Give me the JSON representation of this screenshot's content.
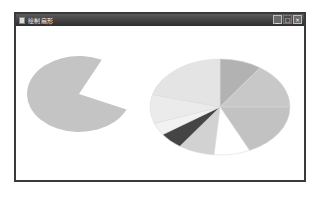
{
  "window": {
    "title": "绘制扇形",
    "controls": {
      "minimize_label": "_",
      "maximize_label": "□",
      "close_label": "×"
    }
  },
  "colors": {
    "titlebar": "#3a3a3a",
    "window_border": "#3a3a3a",
    "left_pie_fill": "#c4c4c4"
  },
  "left_pie": {
    "cx": 63,
    "cy": 68,
    "rx": 52,
    "ry": 38,
    "missing_wedge_deg": [
      296,
      24
    ],
    "fill": "#c4c4c4"
  },
  "right_pie": {
    "cx": 204,
    "cy": 81,
    "rx": 70,
    "ry": 48,
    "slices": [
      {
        "start": -90,
        "end": -55,
        "fill": "#b2b2b2"
      },
      {
        "start": -55,
        "end": 0,
        "fill": "#c8c8c8"
      },
      {
        "start": 0,
        "end": 65,
        "fill": "#c2c2c2"
      },
      {
        "start": 65,
        "end": 95,
        "fill": "#ffffff"
      },
      {
        "start": 95,
        "end": 125,
        "fill": "#d2d2d2"
      },
      {
        "start": 125,
        "end": 145,
        "fill": "#454545"
      },
      {
        "start": 145,
        "end": 160,
        "fill": "#f2f2f2"
      },
      {
        "start": 160,
        "end": 195,
        "fill": "#ebebeb"
      },
      {
        "start": 195,
        "end": 270,
        "fill": "#e4e4e4"
      }
    ]
  }
}
